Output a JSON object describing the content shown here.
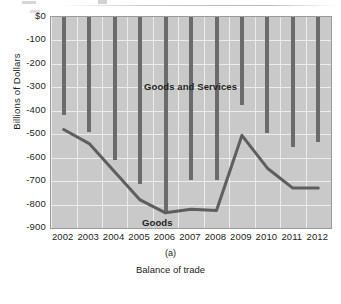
{
  "figure": {
    "subcaption": "(a)",
    "caption": "Balance of trade"
  },
  "axes": {
    "ylabel": "Billions of Dollars",
    "yticks": [
      "$0",
      "-100",
      "-200",
      "-300",
      "-400",
      "-500",
      "-600",
      "-700",
      "-800",
      "-900"
    ],
    "xticks": [
      "2002",
      "2003",
      "2004",
      "2005",
      "2006",
      "2007",
      "2008",
      "2009",
      "2010",
      "2011",
      "2012"
    ]
  },
  "series_labels": {
    "goods_and_services": "Goods and Services",
    "goods": "Goods"
  },
  "colors": {
    "plot_background": "#c9c9c9",
    "gridline": "#ececeb",
    "bar": "#6b6b6b",
    "line": "#5e5e5e",
    "text": "#231f20",
    "frame": "#9a9a9a"
  },
  "chart_data": {
    "type": "bar",
    "title": "",
    "subtitle": "(a)",
    "xlabel": "Balance of trade",
    "ylabel": "Billions of Dollars",
    "categories": [
      "2002",
      "2003",
      "2004",
      "2005",
      "2006",
      "2007",
      "2008",
      "2009",
      "2010",
      "2011",
      "2012"
    ],
    "ylim": [
      -900,
      0
    ],
    "ytick_values": [
      0,
      -100,
      -200,
      -300,
      -400,
      -500,
      -600,
      -700,
      -800,
      -900
    ],
    "grid": true,
    "legend": "in-plot text labels",
    "series": [
      {
        "name": "Goods and Services",
        "type": "bar",
        "values": [
          -418,
          -490,
          -608,
          -710,
          -835,
          -695,
          -695,
          -375,
          -495,
          -555,
          -535
        ]
      },
      {
        "name": "Goods",
        "type": "line",
        "values": [
          -480,
          -540,
          -660,
          -780,
          -835,
          -820,
          -825,
          -505,
          -645,
          -730,
          -730
        ]
      }
    ],
    "annotations": [
      {
        "text": "Goods and Services",
        "x": "2003.5",
        "y": -230
      },
      {
        "text": "Goods",
        "x": "2003.5",
        "y": -810
      }
    ]
  }
}
